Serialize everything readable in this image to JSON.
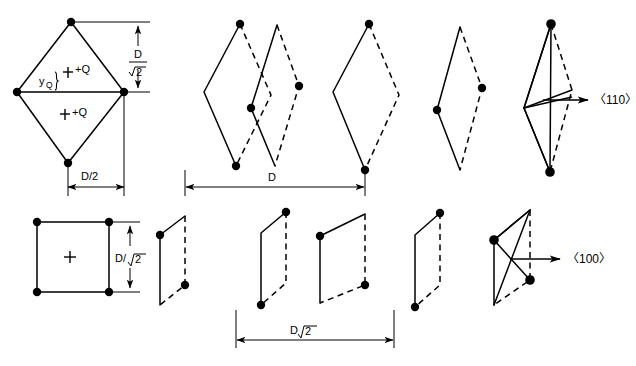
{
  "figure": {
    "title": "",
    "background_color": "#ffffff",
    "line_color": "#000000",
    "width": 636,
    "height": 366
  },
  "labels": {
    "charge_upper": "+Q",
    "charge_lower": "+Q",
    "y_q": "y",
    "y_q_sub": "Q",
    "dim_d_over_sqrt2_num": "D",
    "dim_d_over_sqrt2_den": "2",
    "dim_d_over_2": "D/2",
    "dim_d": "D",
    "dim_d_sqrt2": "D",
    "dim_d_sqrt2_radicand": "2",
    "dim_d_over_sqrt2_square": "D/",
    "dim_d_over_sqrt2_square_radicand": "2",
    "direction_110": "〈110〉",
    "direction_100": "〈100〉"
  },
  "top_row": {
    "description": "Row of rhombic (diamond) cross-sections viewed along the 110 direction",
    "unit_cell_label": "rhombic-unit-cell",
    "shapes": [
      {
        "name": "rhombus-reference",
        "dots": "top-bottom"
      },
      {
        "name": "rhombus-1",
        "dots": "top-bottom"
      },
      {
        "name": "rhombus-2",
        "dots": "left-right"
      },
      {
        "name": "rhombus-3",
        "dots": "top-bottom"
      },
      {
        "name": "rhombus-4",
        "dots": "left-right"
      },
      {
        "name": "rhombus-overlay",
        "dots": "top-bottom"
      }
    ],
    "dimension": "D"
  },
  "bottom_row": {
    "description": "Row of square / parallelogram cross-sections viewed along the 100 direction",
    "unit_cell_label": "square-unit-cell",
    "shapes": [
      {
        "name": "square-reference",
        "dots": "four-corners"
      },
      {
        "name": "parallelogram-1",
        "dots": "top-left-bottom-right"
      },
      {
        "name": "parallelogram-2",
        "dots": "top-right-bottom-left"
      },
      {
        "name": "parallelogram-3",
        "dots": "top-left-bottom-right"
      },
      {
        "name": "parallelogram-4",
        "dots": "top-right-bottom-left"
      },
      {
        "name": "parallelogram-overlay",
        "dots": "top-left-bottom-right"
      }
    ],
    "dimension": "D√2"
  }
}
